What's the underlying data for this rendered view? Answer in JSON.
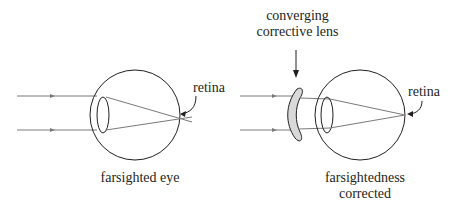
{
  "left_diagram": {
    "caption": "farsighted eye",
    "retina_label": "retina"
  },
  "right_diagram": {
    "caption_line1": "farsightedness",
    "caption_line2": "corrected",
    "retina_label": "retina",
    "lens_label_line1": "converging",
    "lens_label_line2": "corrective lens"
  },
  "colors": {
    "stroke": "#231f20",
    "ray": "#7a7a7a",
    "lens_fill": "#d9d9d9"
  }
}
